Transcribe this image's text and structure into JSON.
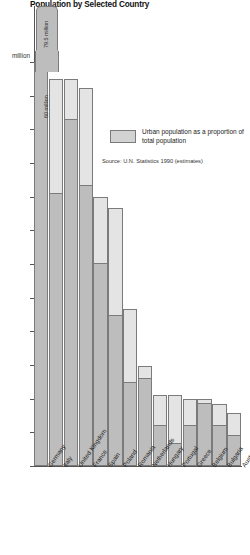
{
  "chart_data": {
    "type": "bar",
    "title": "Population by Selected Country",
    "xlabel": "",
    "ylabel": "million",
    "ylim": [
      0,
      60
    ],
    "ytick_step": 5,
    "yticks": [
      0,
      5,
      10,
      15,
      20,
      25,
      30,
      35,
      40,
      45,
      50,
      55,
      60
    ],
    "grid": false,
    "axis_note": "Germany bar is broken/truncated above the 60 million axis maximum",
    "categories": [
      "Germany",
      "Italy",
      "United Kingdom",
      "France",
      "Spain",
      "Poland",
      "Romania",
      "Netherlands",
      "Hungary",
      "Portugal",
      "Greece",
      "Belgium",
      "Bulgaria",
      "Austria"
    ],
    "series": [
      {
        "name": "Total population",
        "values": [
          79.5,
          57.5,
          57.5,
          56.2,
          40.0,
          38.3,
          23.3,
          14.8,
          10.6,
          10.6,
          10.0,
          9.9,
          9.2,
          7.9
        ]
      },
      {
        "name": "Urban population as a proportion of total population",
        "values": [
          60.0,
          40.5,
          51.5,
          41.7,
          30.2,
          22.4,
          12.5,
          13.0,
          6.1,
          3.4,
          6.1,
          9.3,
          6.1,
          4.6
        ]
      }
    ],
    "annotations": {
      "germany_total_label": "79.5 million",
      "germany_urban_label": "60 million"
    },
    "legend": {
      "position": "inside-right",
      "entries": [
        {
          "label_line1": "Urban population as a",
          "label_line2": "proportion of total population"
        }
      ]
    },
    "source": "Source: U.N. Statistics 1990 (estimates)",
    "colors": {
      "total_fill": "#e4e4e4",
      "urban_fill": "#bdbdbd",
      "outline": "#7b7b7b",
      "axis": "#555555",
      "text": "#1a1a1a"
    }
  }
}
